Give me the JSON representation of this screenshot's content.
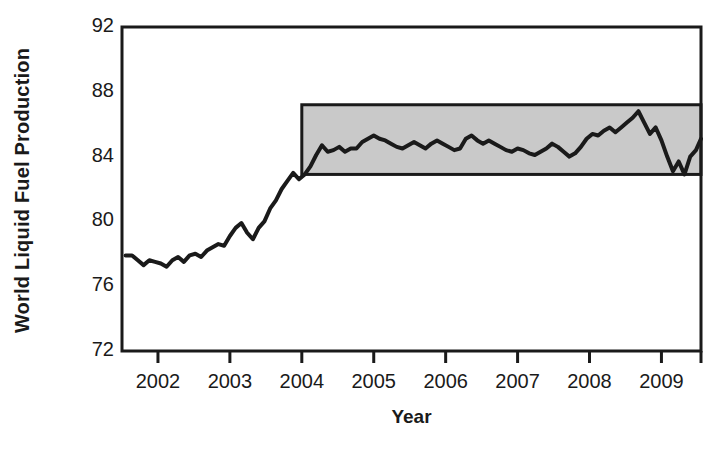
{
  "chart_data": {
    "type": "line",
    "title": "",
    "xlabel": "Year",
    "ylabel": "World Liquid Fuel Production",
    "xlim": [
      2001.5,
      2009.55
    ],
    "ylim": [
      72,
      92
    ],
    "ytick_labels": [
      "92",
      "88",
      "84",
      "80",
      "76",
      "72"
    ],
    "ytick_values": [
      92,
      88,
      84,
      80,
      76,
      72
    ],
    "xtick_labels": [
      "2002",
      "2003",
      "2004",
      "2005",
      "2006",
      "2007",
      "2008",
      "2009"
    ],
    "xtick_values": [
      2002,
      2003,
      2004,
      2005,
      2006,
      2007,
      2008,
      2009
    ],
    "grid": false,
    "legend": "none",
    "line_color": "#1a1a1a",
    "line_width_px": 4,
    "annotations": [
      {
        "name": "plateau-band",
        "type": "shaded-rectangle",
        "x_start": 2004.0,
        "x_end": 2009.55,
        "y_low": 82.9,
        "y_high": 87.2,
        "fill_color": "#c9c9c9",
        "border_color": "#1a1a1a"
      }
    ],
    "series": [
      {
        "name": "World Liquid Fuel Production",
        "units": "million barrels per day",
        "x": [
          2001.55,
          2001.64,
          2001.72,
          2001.8,
          2001.88,
          2001.96,
          2002.04,
          2002.12,
          2002.2,
          2002.28,
          2002.36,
          2002.44,
          2002.52,
          2002.6,
          2002.68,
          2002.76,
          2002.84,
          2002.92,
          2003.0,
          2003.08,
          2003.16,
          2003.24,
          2003.32,
          2003.4,
          2003.48,
          2003.56,
          2003.64,
          2003.72,
          2003.8,
          2003.88,
          2003.96,
          2004.04,
          2004.12,
          2004.2,
          2004.28,
          2004.36,
          2004.44,
          2004.52,
          2004.6,
          2004.68,
          2004.76,
          2004.84,
          2004.92,
          2005.0,
          2005.08,
          2005.16,
          2005.24,
          2005.32,
          2005.4,
          2005.48,
          2005.56,
          2005.64,
          2005.72,
          2005.8,
          2005.88,
          2005.96,
          2006.04,
          2006.12,
          2006.2,
          2006.28,
          2006.36,
          2006.44,
          2006.52,
          2006.6,
          2006.68,
          2006.76,
          2006.84,
          2006.92,
          2007.0,
          2007.08,
          2007.16,
          2007.24,
          2007.32,
          2007.4,
          2007.48,
          2007.56,
          2007.64,
          2007.72,
          2007.8,
          2007.88,
          2007.96,
          2008.04,
          2008.12,
          2008.2,
          2008.28,
          2008.36,
          2008.44,
          2008.52,
          2008.6,
          2008.68,
          2008.76,
          2008.84,
          2008.92,
          2009.0,
          2009.08,
          2009.16,
          2009.24,
          2009.32,
          2009.4,
          2009.48,
          2009.55
        ],
        "y": [
          77.9,
          77.9,
          77.6,
          77.3,
          77.6,
          77.5,
          77.4,
          77.2,
          77.6,
          77.8,
          77.5,
          77.9,
          78.0,
          77.8,
          78.2,
          78.4,
          78.6,
          78.5,
          79.1,
          79.6,
          79.9,
          79.3,
          78.9,
          79.6,
          80.0,
          80.8,
          81.3,
          82.0,
          82.5,
          83.0,
          82.6,
          82.9,
          83.4,
          84.1,
          84.7,
          84.3,
          84.4,
          84.6,
          84.3,
          84.5,
          84.5,
          84.9,
          85.1,
          85.3,
          85.1,
          85.0,
          84.8,
          84.6,
          84.5,
          84.7,
          84.9,
          84.7,
          84.5,
          84.8,
          85.0,
          84.8,
          84.6,
          84.4,
          84.5,
          85.1,
          85.3,
          85.0,
          84.8,
          85.0,
          84.8,
          84.6,
          84.4,
          84.3,
          84.5,
          84.4,
          84.2,
          84.1,
          84.3,
          84.5,
          84.8,
          84.6,
          84.3,
          84.0,
          84.2,
          84.6,
          85.1,
          85.4,
          85.3,
          85.6,
          85.8,
          85.5,
          85.8,
          86.1,
          86.4,
          86.8,
          86.1,
          85.4,
          85.8,
          85.0,
          84.0,
          83.1,
          83.7,
          82.9,
          84.0,
          84.4,
          85.1
        ]
      }
    ]
  },
  "axis": {
    "y_title": "World Liquid Fuel Production",
    "x_title": "Year"
  }
}
